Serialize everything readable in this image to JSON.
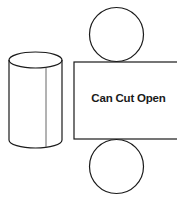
{
  "diagram": {
    "title": "Can Cut Open",
    "label_text": "Can Cut Open",
    "colors": {
      "stroke": "#1a1a1a",
      "inner_line": "#555555",
      "background": "#ffffff"
    },
    "shapes": {
      "cylinder": {
        "cx": 35.5,
        "top_y": 60,
        "bottom_y": 140,
        "rx": 26.5,
        "ry": 8,
        "seam_x": 46
      },
      "top_circle": {
        "cx": 116.5,
        "cy": 34.5,
        "r": 27
      },
      "rectangle": {
        "x": 74,
        "y": 62,
        "width": 110,
        "height": 77
      },
      "bottom_circle": {
        "cx": 116.5,
        "cy": 166.5,
        "r": 27
      }
    }
  }
}
